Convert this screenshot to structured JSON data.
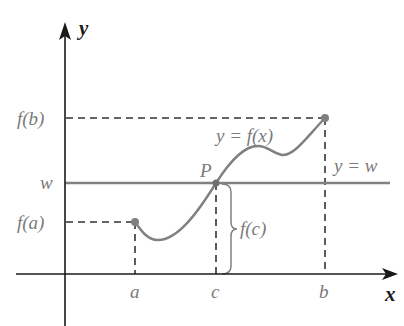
{
  "diagram": {
    "axes": {
      "x_label": "x",
      "y_label": "y"
    },
    "labels": {
      "fb": "f(b)",
      "w": "w",
      "fa": "f(a)",
      "a": "a",
      "c": "c",
      "b": "b",
      "P": "P",
      "curve": "y = f(x)",
      "line": "y = w",
      "fc": "f(c)"
    },
    "colors": {
      "axis": "#1a1a1a",
      "curve": "#808080",
      "dashed": "#333333",
      "label": "#7a7a7a"
    },
    "points": {
      "a_point": [
        135,
        222
      ],
      "b_point": [
        325,
        118
      ],
      "P_point": [
        216,
        183
      ]
    }
  }
}
